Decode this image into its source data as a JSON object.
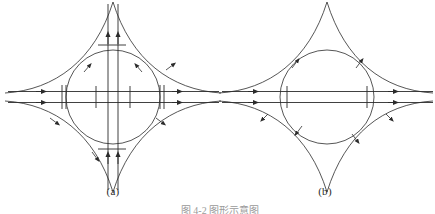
{
  "figure": {
    "background_color": "#ffffff",
    "ink_color": "#2b2b2b",
    "panels": [
      {
        "id": "a",
        "label": "(a)",
        "center_x": 113,
        "center_y": 97,
        "circle_radius": 47,
        "has_vertical_flow_lines": true,
        "has_horizontal_flow_lines": true,
        "description": "astroid with four cusps, inscribed circle, double horizontal and double vertical flow lines with arrowheads and tick marks"
      },
      {
        "id": "b",
        "label": "(b)",
        "center_x": 327,
        "center_y": 97,
        "circle_radius": 47,
        "has_vertical_flow_lines": false,
        "has_horizontal_flow_lines": true,
        "description": "astroid with four cusps, inscribed circle, double horizontal flow lines only with arrowheads and tick marks"
      }
    ],
    "caption_partial": "图 4-2    图形示意图"
  }
}
